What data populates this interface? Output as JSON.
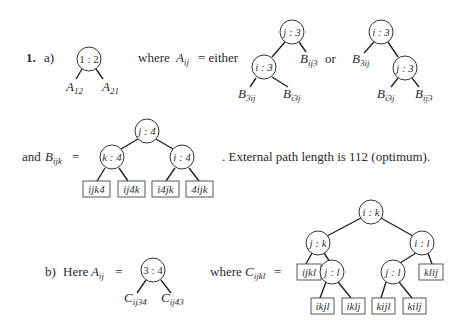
{
  "part1a": {
    "number": "1.",
    "sub": "a)",
    "root": "1 : 2",
    "left_leaf": {
      "base": "A",
      "sub": "12"
    },
    "right_leaf": {
      "base": "A",
      "sub": "21"
    },
    "where_text": "where",
    "Aij": {
      "base": "A",
      "sub": "ij"
    },
    "eq_either": "= either",
    "or_text": "or",
    "tree1": {
      "root": "j : 3",
      "child": "i : 3",
      "right_leaf": {
        "base": "B",
        "sub": "ij3"
      },
      "ll_leaf": {
        "base": "B",
        "sub": "3ij"
      },
      "lr_leaf": {
        "base": "B",
        "sub": "i3j"
      }
    },
    "tree2": {
      "root": "i : 3",
      "left_leaf": {
        "base": "B",
        "sub": "3ij"
      },
      "child": "j : 3",
      "rl_leaf": {
        "base": "B",
        "sub": "i3j"
      },
      "rr_leaf": {
        "base": "B",
        "sub": "ij3"
      }
    }
  },
  "partB": {
    "and_text": "and",
    "Bijk": {
      "base": "B",
      "sub": "ijk"
    },
    "eq": "=",
    "root": "j : 4",
    "left": "k : 4",
    "right": "i : 4",
    "leaves": [
      "ijk4",
      "ij4k",
      "i4jk",
      "4ijk"
    ],
    "sentence": ".  External path length is 112 (optimum)."
  },
  "part1b": {
    "sub": "b)",
    "here": "Here",
    "Aij": {
      "base": "A",
      "sub": "ij"
    },
    "eq": "=",
    "root": "3 : 4",
    "left_leaf": {
      "base": "C",
      "sub": "ij34"
    },
    "right_leaf": {
      "base": "C",
      "sub": "ij43"
    },
    "where_text": "where",
    "Cijkl": {
      "base": "C",
      "sub": "ijkl"
    },
    "eq2": "=",
    "tree": {
      "root": "i : k",
      "left": "j : k",
      "right": "i : l",
      "left_leaf": "ijkl",
      "left_child": "j : l",
      "right_child": "j : l",
      "right_leaf": "klij",
      "bottom_leaves": [
        "ikjl",
        "iklj",
        "kijl",
        "kilj"
      ]
    }
  }
}
